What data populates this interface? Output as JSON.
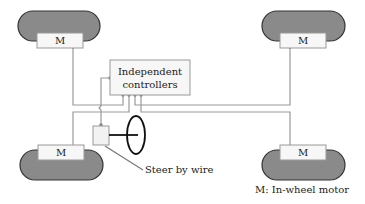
{
  "diagram": {
    "controller_label_line1": "Independent",
    "controller_label_line2": "controllers",
    "motor_label": "M",
    "steer_label": "Steer by wire",
    "legend": "M: In-wheel motor",
    "colors": {
      "tire_fill": "#8a8a8a",
      "tire_stroke": "#333333",
      "wire": "#9a9a9a",
      "box_fill": "#f7f7f7",
      "box_stroke": "#999999",
      "steering": "#111111"
    }
  }
}
